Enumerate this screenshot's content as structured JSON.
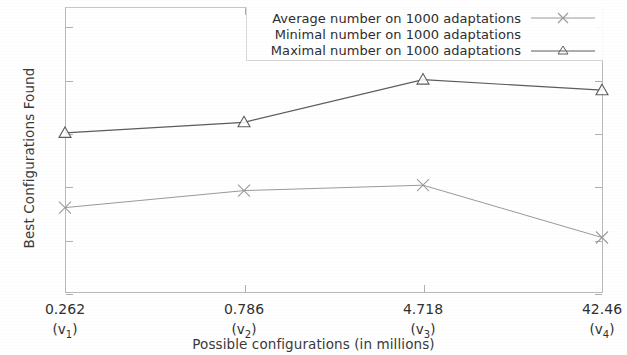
{
  "chart_data": {
    "type": "line",
    "title": "",
    "xlabel": "Possible configurations (in millions)",
    "ylabel": "Best Configurations Found",
    "categories": [
      "0.262",
      "0.786",
      "4.718",
      "42.46"
    ],
    "category_subscripts": [
      "(v1)",
      "(v2)",
      "(v3)",
      "(v4)"
    ],
    "category_sub_base": [
      "v",
      "v",
      "v",
      "v"
    ],
    "category_sub_index": [
      "1",
      "2",
      "3",
      "4"
    ],
    "xticklabels": [
      "0.262",
      "0.786",
      "4.718",
      "42.46"
    ],
    "yticklabels": [
      "0",
      "5",
      "10",
      "15",
      "20",
      "25"
    ],
    "yticks": [
      0,
      5,
      10,
      15,
      20,
      25
    ],
    "ylim": [
      0,
      26.8
    ],
    "grid": false,
    "legend_position": "upper right",
    "series": [
      {
        "name": "Average number on 1000 adaptations",
        "marker": "x",
        "color": "#9a9a9a",
        "values": [
          8.0,
          9.6,
          10.1,
          5.2
        ],
        "visible": true
      },
      {
        "name": "Minimal number on 1000 adaptations",
        "marker": "none",
        "color": "#c9c9c9",
        "values": [
          null,
          null,
          null,
          null
        ],
        "visible": false
      },
      {
        "name": "Maximal number on 1000 adaptations",
        "marker": "triangle",
        "color": "#5c5c5c",
        "values": [
          15.0,
          16.0,
          20.0,
          19.0
        ],
        "visible": true
      }
    ]
  },
  "axes": {
    "ylabel": "Best Configurations Found",
    "xlabel": "Possible configurations (in millions)"
  },
  "legend": {
    "rows": [
      {
        "label": "Average number on 1000 adaptations"
      },
      {
        "label": "Minimal number on 1000 adaptations"
      },
      {
        "label": "Maximal number on 1000 adaptations"
      }
    ]
  }
}
